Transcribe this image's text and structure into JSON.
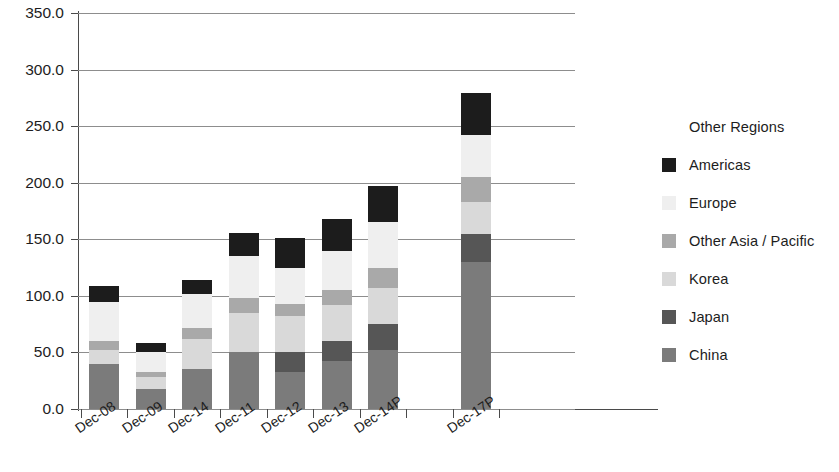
{
  "chart_data": {
    "type": "bar",
    "stacked": true,
    "title": "",
    "subtitle": "",
    "xlabel": "",
    "ylabel": "",
    "ylim": [
      0.0,
      350.0
    ],
    "ytick_step": 50.0,
    "ytick_labels": [
      "350.0",
      "300.0",
      "250.0",
      "200.0",
      "150.0",
      "100.0",
      "50.0",
      "0.0"
    ],
    "ytick_values": [
      350.0,
      300.0,
      250.0,
      200.0,
      150.0,
      100.0,
      50.0,
      0.0
    ],
    "grid": true,
    "grid_axis": "y",
    "legend_position": "right",
    "categories": [
      "Dec-08",
      "Dec-09",
      "Dec-14",
      "Dec-11",
      "Dec-12",
      "Dec-13",
      "Dec-14P",
      "",
      "Dec-17P"
    ],
    "series": [
      {
        "name": "China",
        "color": "#7b7b7b",
        "values": [
          40.0,
          18.0,
          35.0,
          50.0,
          33.0,
          42.0,
          52.0,
          null,
          130.0
        ]
      },
      {
        "name": "Japan",
        "color": "#565656",
        "values": [
          0.0,
          0.0,
          0.0,
          0.0,
          17.0,
          18.0,
          23.0,
          null,
          25.0
        ]
      },
      {
        "name": "Korea",
        "color": "#d9d9d9",
        "values": [
          12.0,
          10.0,
          27.0,
          35.0,
          32.0,
          32.0,
          32.0,
          null,
          28.0
        ]
      },
      {
        "name": "Other Asia / Pacific",
        "color": "#a9a9a9",
        "values": [
          8.0,
          5.0,
          10.0,
          13.0,
          11.0,
          13.0,
          18.0,
          null,
          22.0
        ]
      },
      {
        "name": "Europe",
        "color": "#efefef",
        "values": [
          35.0,
          17.0,
          30.0,
          37.0,
          32.0,
          35.0,
          40.0,
          null,
          37.0
        ]
      },
      {
        "name": "Americas",
        "color": "#1c1c1c",
        "values": [
          14.0,
          8.0,
          12.0,
          21.0,
          26.0,
          28.0,
          32.0,
          null,
          37.0
        ]
      },
      {
        "name": "Other Regions",
        "color": "#ffffff",
        "values": [
          0.0,
          0.0,
          0.0,
          0.0,
          0.0,
          0.0,
          0.0,
          null,
          0.0
        ]
      }
    ],
    "totals": [
      109.0,
      58.0,
      114.0,
      156.0,
      151.0,
      168.0,
      197.0,
      null,
      279.0
    ]
  },
  "legend": {
    "entries": [
      {
        "label": "Other Regions",
        "color": "#ffffff"
      },
      {
        "label": "Americas",
        "color": "#1c1c1c"
      },
      {
        "label": "Europe",
        "color": "#efefef"
      },
      {
        "label": "Other Asia / Pacific",
        "color": "#a9a9a9"
      },
      {
        "label": "Korea",
        "color": "#d9d9d9"
      },
      {
        "label": "Japan",
        "color": "#565656"
      },
      {
        "label": "China",
        "color": "#7b7b7b"
      }
    ]
  },
  "axis": {
    "y_labels": [
      "350.0",
      "300.0",
      "250.0",
      "200.0",
      "150.0",
      "100.0",
      "50.0",
      "0.0"
    ],
    "x_labels": [
      "Dec-08",
      "Dec-09",
      "Dec-14",
      "Dec-11",
      "Dec-12",
      "Dec-13",
      "Dec-14P",
      "Dec-17P"
    ]
  },
  "colors": {
    "axis": "#4a4a4a",
    "grid": "#8d8d8d",
    "text": "#1d1d1d",
    "background": "#ffffff"
  }
}
